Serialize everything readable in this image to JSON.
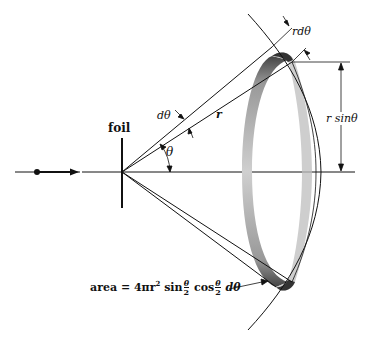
{
  "diagram": {
    "labels": {
      "foil": "foil",
      "r_dtheta": "rdθ",
      "d_theta": "dθ",
      "r": "r",
      "theta": "θ",
      "r_sin_theta": "r sinθ",
      "area_prefix": "area = 4πr",
      "area_exp": "2",
      "area_sin": "sin",
      "area_cos": "cos",
      "frac_num": "θ",
      "frac_den": "2",
      "area_suffix": "dθ"
    },
    "colors": {
      "line": "#111111",
      "ring_light": "#c8c8c8",
      "ring_dark": "#555555",
      "background": "#ffffff"
    },
    "elements": [
      "incident particle with arrow",
      "foil (vertical line)",
      "horizontal beam axis",
      "cone of scattered rays at angle θ and θ+dθ",
      "spherical shell arc of radius r",
      "shaded annular ring of area 4πr² sin(θ/2) cos(θ/2) dθ",
      "dimension r sinθ",
      "dimension r dθ"
    ]
  }
}
